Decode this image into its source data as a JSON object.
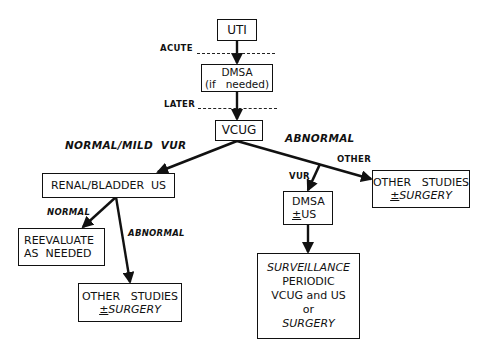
{
  "diagram": {
    "nodes": {
      "uti": {
        "label": "UTI"
      },
      "dmsa_initial": {
        "line1": "DMSA",
        "line2": "(if   needed)"
      },
      "vcug": {
        "label": "VCUG"
      },
      "renal_bladder_us": {
        "label": "RENAL/BLADDER  US"
      },
      "reevaluate": {
        "line1": "REEVALUATE",
        "line2": "AS  NEEDED"
      },
      "other_studies_left": {
        "line1": "OTHER   STUDIES",
        "pm": "±",
        "line2": "SURGERY"
      },
      "dmsa_us": {
        "line1": "DMSA",
        "pm": "±",
        "line2": "US"
      },
      "other_studies_right": {
        "line1": "OTHER   STUDIES",
        "pm": "±",
        "line2": "SURGERY"
      },
      "surveillance": {
        "line1": "SURVEILLANCE",
        "line2": "PERIODIC",
        "line3": "VCUG and US",
        "line4": "or",
        "line5": "SURGERY"
      }
    },
    "timing_labels": {
      "acute": "ACUTE",
      "later": "LATER"
    },
    "edge_labels": {
      "normal_mild_vur": "NORMAL/MILD  VUR",
      "abnormal_vcug": "ABNORMAL",
      "other": "OTHER",
      "vur": "VUR",
      "normal": "NORMAL",
      "abnormal_us": "ABNORMAL"
    },
    "edges": [
      {
        "from": "uti",
        "to": "dmsa_initial"
      },
      {
        "from": "dmsa_initial",
        "to": "vcug"
      },
      {
        "from": "vcug",
        "to": "renal_bladder_us",
        "label": "NORMAL/MILD VUR"
      },
      {
        "from": "vcug",
        "to": "other_studies_right",
        "label": "ABNORMAL / OTHER"
      },
      {
        "from": "vcug",
        "to": "dmsa_us",
        "label": "ABNORMAL / VUR"
      },
      {
        "from": "renal_bladder_us",
        "to": "reevaluate",
        "label": "NORMAL"
      },
      {
        "from": "renal_bladder_us",
        "to": "other_studies_left",
        "label": "ABNORMAL"
      },
      {
        "from": "dmsa_us",
        "to": "surveillance"
      }
    ]
  }
}
